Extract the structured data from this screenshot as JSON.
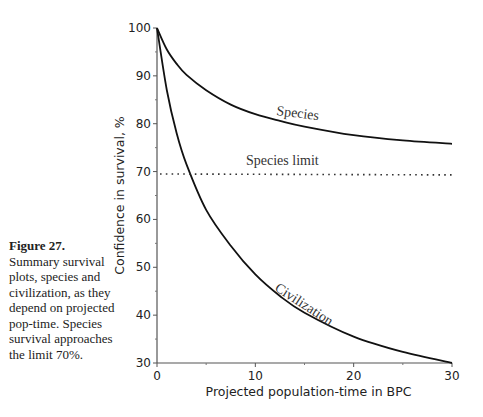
{
  "caption": {
    "title": "Figure 27.",
    "text": "Summary survival plots, species and civilization, as they depend on projected pop-time. Species survival approaches the limit 70%."
  },
  "chart_data": {
    "type": "line",
    "title": "",
    "xlabel": "Projected population-time in BPC",
    "ylabel": "Confidence in survival, %",
    "xlim": [
      0,
      30
    ],
    "ylim": [
      30,
      100
    ],
    "xticks": [
      0,
      10,
      20,
      30
    ],
    "yticks": [
      30,
      40,
      50,
      60,
      70,
      80,
      90,
      100
    ],
    "grid": false,
    "legend": "inline labels",
    "x": [
      0,
      1,
      2,
      3,
      5,
      7.5,
      10,
      12.5,
      15,
      20,
      25,
      30
    ],
    "series": [
      {
        "name": "Species",
        "values": [
          100,
          95.5,
          92.5,
          90.2,
          87,
          84,
          82,
          80.6,
          79.4,
          77.6,
          76.5,
          75.8
        ]
      },
      {
        "name": "Civilization",
        "values": [
          100,
          87,
          78,
          71.5,
          62,
          54.5,
          48.5,
          44,
          40.5,
          35.5,
          32.3,
          30
        ]
      },
      {
        "name": "Species limit",
        "values": [
          69.5,
          69.5,
          69.5,
          69.5,
          69.5,
          69.5,
          69.5,
          69.5,
          69.5,
          69.5,
          69.5,
          69.3
        ],
        "style": "dotted"
      }
    ],
    "annotations": [
      "Species",
      "Species limit",
      "Civilization"
    ]
  }
}
